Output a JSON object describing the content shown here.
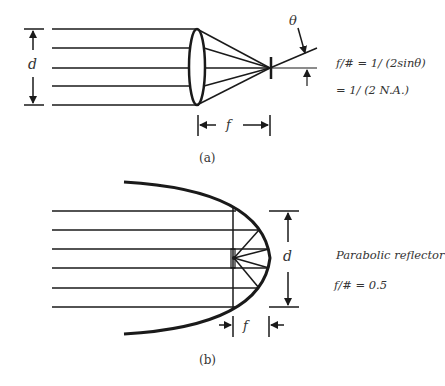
{
  "panel_a": {
    "caption": "(a)",
    "diameter_label": "d",
    "focal_label": "f",
    "angle_label": "θ",
    "formula_line1": "f/# = 1/ (2sinθ)",
    "formula_line2": "= 1/ (2 N.A.)",
    "element": "lens",
    "ray_count": 5
  },
  "panel_b": {
    "caption": "(b)",
    "diameter_label": "d",
    "focal_label": "f",
    "title": "Parabolic reflector",
    "formula": "f/# = 0.5",
    "element": "parabolic-mirror",
    "ray_count": 6
  },
  "colors": {
    "line": "#1a1a1a",
    "text": "#333333",
    "background": "#ffffff"
  }
}
